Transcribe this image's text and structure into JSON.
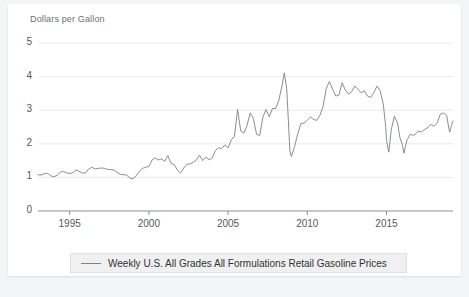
{
  "chart_data": {
    "type": "line",
    "title": "",
    "ylabel": "Dollars per Gallon",
    "xlabel": "",
    "ylim": [
      0,
      5
    ],
    "xlim": [
      1993.0,
      2019.2
    ],
    "grid": true,
    "legend_position": "bottom",
    "y_ticks": [
      "0",
      "1",
      "2",
      "3",
      "4",
      "5"
    ],
    "y_tick_values": [
      0,
      1,
      2,
      3,
      4,
      5
    ],
    "x_ticks": [
      "1995",
      "2000",
      "2005",
      "2010",
      "2015"
    ],
    "x_tick_values": [
      1995,
      2000,
      2005,
      2010,
      2015
    ],
    "line_color": "#7c8088",
    "series": [
      {
        "name": "Weekly U.S. All Grades All Formulations Retail Gasoline Prices",
        "x": [
          1993.0,
          1993.2,
          1993.4,
          1993.6,
          1993.8,
          1994.0,
          1994.2,
          1994.4,
          1994.6,
          1994.8,
          1995.0,
          1995.2,
          1995.4,
          1995.6,
          1995.8,
          1996.0,
          1996.2,
          1996.4,
          1996.6,
          1996.8,
          1997.0,
          1997.2,
          1997.4,
          1997.6,
          1997.8,
          1998.0,
          1998.2,
          1998.4,
          1998.6,
          1998.8,
          1999.0,
          1999.2,
          1999.4,
          1999.6,
          1999.8,
          2000.0,
          2000.2,
          2000.4,
          2000.6,
          2000.8,
          2001.0,
          2001.2,
          2001.4,
          2001.6,
          2001.8,
          2002.0,
          2002.2,
          2002.4,
          2002.6,
          2002.8,
          2003.0,
          2003.2,
          2003.4,
          2003.6,
          2003.8,
          2004.0,
          2004.2,
          2004.4,
          2004.6,
          2004.8,
          2005.0,
          2005.2,
          2005.4,
          2005.6,
          2005.8,
          2006.0,
          2006.2,
          2006.4,
          2006.6,
          2006.8,
          2007.0,
          2007.2,
          2007.4,
          2007.6,
          2007.8,
          2008.0,
          2008.2,
          2008.4,
          2008.55,
          2008.7,
          2008.8,
          2008.9,
          2009.0,
          2009.2,
          2009.4,
          2009.6,
          2009.8,
          2010.0,
          2010.2,
          2010.4,
          2010.6,
          2010.8,
          2011.0,
          2011.2,
          2011.4,
          2011.6,
          2011.8,
          2012.0,
          2012.2,
          2012.4,
          2012.6,
          2012.8,
          2013.0,
          2013.2,
          2013.4,
          2013.6,
          2013.8,
          2014.0,
          2014.2,
          2014.4,
          2014.6,
          2014.8,
          2014.95,
          2015.0,
          2015.15,
          2015.3,
          2015.5,
          2015.7,
          2015.85,
          2016.0,
          2016.1,
          2016.3,
          2016.5,
          2016.7,
          2016.9,
          2017.0,
          2017.2,
          2017.4,
          2017.6,
          2017.8,
          2018.0,
          2018.2,
          2018.4,
          2018.6,
          2018.8,
          2018.95,
          2019.0,
          2019.1,
          2019.2
        ],
        "values": [
          1.08,
          1.07,
          1.11,
          1.12,
          1.05,
          1.02,
          1.06,
          1.15,
          1.18,
          1.14,
          1.11,
          1.14,
          1.22,
          1.18,
          1.13,
          1.13,
          1.25,
          1.3,
          1.25,
          1.27,
          1.28,
          1.27,
          1.24,
          1.23,
          1.22,
          1.15,
          1.09,
          1.08,
          1.07,
          0.98,
          0.96,
          1.05,
          1.18,
          1.27,
          1.3,
          1.33,
          1.52,
          1.58,
          1.52,
          1.55,
          1.48,
          1.65,
          1.42,
          1.38,
          1.22,
          1.13,
          1.28,
          1.39,
          1.4,
          1.45,
          1.52,
          1.66,
          1.5,
          1.6,
          1.52,
          1.58,
          1.8,
          1.88,
          1.86,
          1.97,
          1.88,
          2.12,
          2.22,
          3.02,
          2.38,
          2.32,
          2.55,
          2.92,
          2.75,
          2.28,
          2.25,
          2.8,
          3.02,
          2.8,
          3.05,
          3.05,
          3.28,
          3.72,
          4.11,
          3.65,
          2.75,
          1.78,
          1.62,
          1.92,
          2.3,
          2.6,
          2.62,
          2.7,
          2.8,
          2.72,
          2.7,
          2.85,
          3.12,
          3.65,
          3.85,
          3.62,
          3.42,
          3.45,
          3.82,
          3.6,
          3.48,
          3.55,
          3.72,
          3.62,
          3.52,
          3.58,
          3.42,
          3.38,
          3.52,
          3.72,
          3.58,
          3.18,
          2.52,
          2.1,
          1.75,
          2.42,
          2.82,
          2.62,
          2.18,
          1.98,
          1.72,
          2.12,
          2.28,
          2.25,
          2.32,
          2.38,
          2.35,
          2.42,
          2.48,
          2.58,
          2.52,
          2.62,
          2.88,
          2.92,
          2.85,
          2.42,
          2.35,
          2.55,
          2.68
        ]
      }
    ]
  },
  "legend": {
    "label": "Weekly U.S. All Grades All Formulations Retail Gasoline Prices"
  }
}
